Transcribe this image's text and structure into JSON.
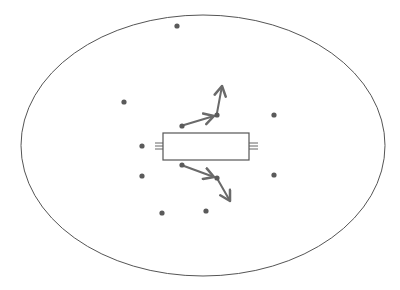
{
  "colors": {
    "background": "#ffffff",
    "stroke": "#555555",
    "dot": "#5a5a5a",
    "arrow": "#6a6a6a",
    "rect_fill": "#ffffff"
  },
  "boundary": {
    "shape": "ellipse",
    "cx": 203,
    "cy": 145.5,
    "rx": 182,
    "ry": 130.5
  },
  "device": {
    "shape": "rectangle",
    "x": 163,
    "y": 133,
    "width": 86,
    "height": 27
  },
  "terminals": [
    {
      "side": "left",
      "x1": 155,
      "x2": 163,
      "ys": [
        143,
        146,
        149
      ]
    },
    {
      "side": "right",
      "x1": 249,
      "x2": 258,
      "ys": [
        143,
        146,
        149
      ]
    }
  ],
  "dots": [
    {
      "x": 177,
      "y": 26
    },
    {
      "x": 124,
      "y": 102
    },
    {
      "x": 274,
      "y": 115
    },
    {
      "x": 182,
      "y": 126
    },
    {
      "x": 217,
      "y": 115
    },
    {
      "x": 142,
      "y": 146
    },
    {
      "x": 142,
      "y": 176
    },
    {
      "x": 182,
      "y": 165
    },
    {
      "x": 217,
      "y": 178
    },
    {
      "x": 274,
      "y": 175
    },
    {
      "x": 162,
      "y": 213
    },
    {
      "x": 206,
      "y": 211
    }
  ],
  "arrows": [
    {
      "x1": 184,
      "y1": 125,
      "x2": 214,
      "y2": 116
    },
    {
      "x1": 217,
      "y1": 113,
      "x2": 222,
      "y2": 86
    },
    {
      "x1": 184,
      "y1": 166,
      "x2": 214,
      "y2": 177
    },
    {
      "x1": 218,
      "y1": 180,
      "x2": 230,
      "y2": 201
    }
  ]
}
